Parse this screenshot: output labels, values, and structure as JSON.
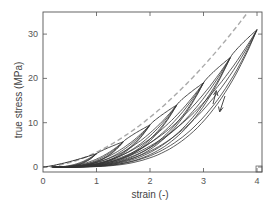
{
  "chart_data": {
    "type": "line",
    "title": "",
    "xlabel": "strain (-)",
    "ylabel": "true stress (MPa)",
    "xlim": [
      0,
      4.1
    ],
    "ylim": [
      -1,
      35
    ],
    "xticks": [
      0,
      1,
      2,
      3,
      4
    ],
    "yticks": [
      0,
      10,
      20,
      30
    ],
    "xtick_labels": [
      "0",
      "1",
      "2",
      "3",
      "4"
    ],
    "ytick_labels": [
      "0",
      "10",
      "20",
      "30"
    ],
    "grid": false,
    "legend": null,
    "series": [
      {
        "name": "monotonic envelope",
        "style": "dashed",
        "color": "#aaaaaa",
        "x": [
          0,
          0.5,
          1.0,
          1.5,
          2.0,
          2.5,
          3.0,
          3.5,
          3.8
        ],
        "y": [
          0,
          1.5,
          3.6,
          6.8,
          10.8,
          15.5,
          21.0,
          28.0,
          34.5
        ]
      },
      {
        "name": "cyclic loading-unloading",
        "style": "solid",
        "color": "#333333",
        "cycles": [
          {
            "max_strain": 1.0,
            "peak_stress": 3.0
          },
          {
            "max_strain": 1.5,
            "peak_stress": 5.7
          },
          {
            "max_strain": 2.0,
            "peak_stress": 9.5
          },
          {
            "max_strain": 2.5,
            "peak_stress": 14.0
          },
          {
            "max_strain": 3.0,
            "peak_stress": 19.0
          },
          {
            "max_strain": 3.5,
            "peak_stress": 24.7
          },
          {
            "max_strain": 4.0,
            "peak_stress": 31.0
          }
        ]
      }
    ],
    "annotations": [
      {
        "type": "arrow",
        "direction": "up",
        "meaning": "loading",
        "x": 3.2,
        "y": 16
      },
      {
        "type": "arrow",
        "direction": "down",
        "meaning": "unloading",
        "x": 3.35,
        "y": 14
      }
    ]
  }
}
